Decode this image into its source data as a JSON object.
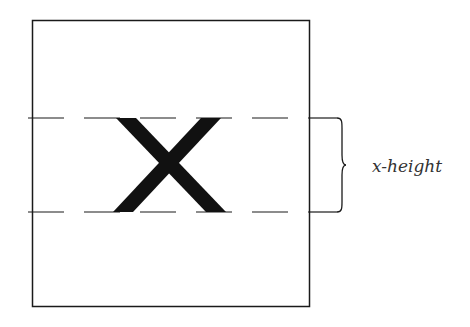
{
  "diagram": {
    "glyph": "x",
    "label": "x-height",
    "colors": {
      "ink": "#1a1a1a",
      "background": "#ffffff"
    }
  }
}
